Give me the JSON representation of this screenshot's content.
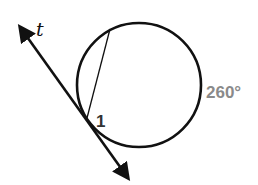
{
  "diagram": {
    "type": "circle-tangent-chord",
    "labels": {
      "tangent": "t",
      "angle": "1",
      "arc": "260°"
    },
    "colors": {
      "stroke": "#111111",
      "arc_label": "#8a8a8a",
      "angle_label": "#333333"
    }
  }
}
